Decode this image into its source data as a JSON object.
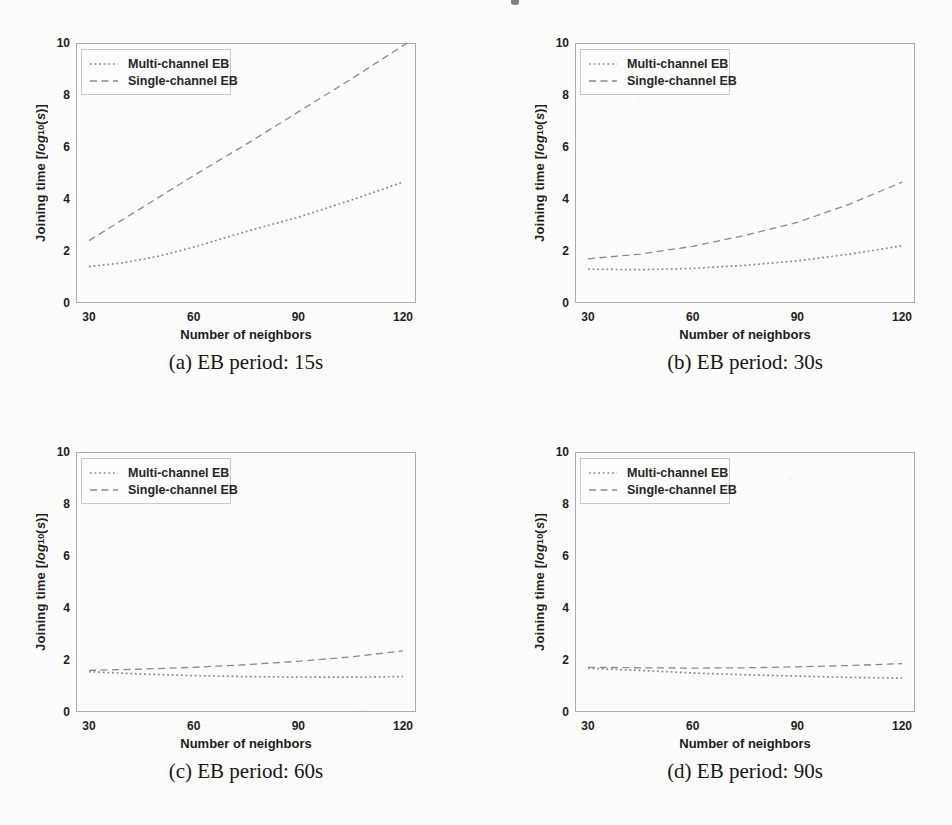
{
  "colors": {
    "line": "#8a8a8a",
    "text": "#1e1e1e",
    "frame": "#ababab",
    "page_background": "#fcfcfa"
  },
  "chart_data": [
    {
      "id": "a",
      "type": "line",
      "caption": "(a) EB period: 15s",
      "xlabel": "Number of neighbors",
      "ylabel_text": "Joining time [log10(s)]",
      "ylabel_parts": [
        {
          "text": "Joining time [",
          "style": "normal"
        },
        {
          "text": "log",
          "style": "italic"
        },
        {
          "text": "10",
          "style": "sub"
        },
        {
          "text": "(",
          "style": "normal"
        },
        {
          "text": "s",
          "style": "italic"
        },
        {
          "text": ")]",
          "style": "normal"
        }
      ],
      "xlim": [
        30,
        120
      ],
      "ylim": [
        0,
        10
      ],
      "x_ticks": [
        30,
        60,
        90,
        120
      ],
      "y_ticks": [
        0,
        2,
        4,
        6,
        8,
        10
      ],
      "grid": false,
      "legend_position": "upper-left",
      "legend": [
        {
          "label": "Multi-channel EB",
          "style": "dotted"
        },
        {
          "label": "Single-channel EB",
          "style": "dashed"
        }
      ],
      "series": [
        {
          "name": "Multi-channel EB",
          "style": "dotted",
          "points": [
            [
              30,
              1.4
            ],
            [
              40,
              1.55
            ],
            [
              50,
              1.8
            ],
            [
              60,
              2.15
            ],
            [
              75,
              2.75
            ],
            [
              90,
              3.3
            ],
            [
              105,
              3.95
            ],
            [
              120,
              4.65
            ]
          ]
        },
        {
          "name": "Single-channel EB",
          "style": "dashed",
          "extend_past_axis": true,
          "points": [
            [
              30,
              2.4
            ],
            [
              45,
              3.65
            ],
            [
              60,
              4.9
            ],
            [
              75,
              6.1
            ],
            [
              90,
              7.35
            ],
            [
              105,
              8.6
            ],
            [
              120,
              9.9
            ]
          ]
        }
      ]
    },
    {
      "id": "b",
      "type": "line",
      "caption": "(b) EB period: 30s",
      "xlabel": "Number of neighbors",
      "ylabel_text": "Joining time [log10(s)]",
      "ylabel_parts": [
        {
          "text": "Joining time [",
          "style": "normal"
        },
        {
          "text": "log",
          "style": "italic"
        },
        {
          "text": "10",
          "style": "sub"
        },
        {
          "text": "(",
          "style": "normal"
        },
        {
          "text": "s",
          "style": "italic"
        },
        {
          "text": ")]",
          "style": "normal"
        }
      ],
      "xlim": [
        30,
        120
      ],
      "ylim": [
        0,
        10
      ],
      "x_ticks": [
        30,
        60,
        90,
        120
      ],
      "y_ticks": [
        0,
        2,
        4,
        6,
        8,
        10
      ],
      "grid": false,
      "legend_position": "upper-left",
      "legend": [
        {
          "label": "Multi-channel EB",
          "style": "dotted"
        },
        {
          "label": "Single-channel EB",
          "style": "dashed"
        }
      ],
      "series": [
        {
          "name": "Multi-channel EB",
          "style": "dotted",
          "points": [
            [
              30,
              1.3
            ],
            [
              45,
              1.28
            ],
            [
              60,
              1.33
            ],
            [
              75,
              1.45
            ],
            [
              90,
              1.62
            ],
            [
              105,
              1.88
            ],
            [
              120,
              2.2
            ]
          ]
        },
        {
          "name": "Single-channel EB",
          "style": "dashed",
          "points": [
            [
              30,
              1.7
            ],
            [
              45,
              1.88
            ],
            [
              60,
              2.18
            ],
            [
              75,
              2.6
            ],
            [
              90,
              3.1
            ],
            [
              105,
              3.8
            ],
            [
              120,
              4.65
            ]
          ]
        }
      ]
    },
    {
      "id": "c",
      "type": "line",
      "caption": "(c) EB period: 60s",
      "xlabel": "Number of neighbors",
      "ylabel_text": "Joining time [log10(s)]",
      "ylabel_parts": [
        {
          "text": "Joining time [",
          "style": "normal"
        },
        {
          "text": "log",
          "style": "italic"
        },
        {
          "text": "10",
          "style": "sub"
        },
        {
          "text": "(",
          "style": "normal"
        },
        {
          "text": "s",
          "style": "italic"
        },
        {
          "text": ")]",
          "style": "normal"
        }
      ],
      "xlim": [
        30,
        120
      ],
      "ylim": [
        0,
        10
      ],
      "x_ticks": [
        30,
        60,
        90,
        120
      ],
      "y_ticks": [
        0,
        2,
        4,
        6,
        8,
        10
      ],
      "grid": false,
      "legend_position": "upper-left",
      "legend": [
        {
          "label": "Multi-channel EB",
          "style": "dotted"
        },
        {
          "label": "Single-channel EB",
          "style": "dashed"
        }
      ],
      "series": [
        {
          "name": "Multi-channel EB",
          "style": "dotted",
          "points": [
            [
              30,
              1.55
            ],
            [
              45,
              1.46
            ],
            [
              60,
              1.4
            ],
            [
              75,
              1.36
            ],
            [
              90,
              1.34
            ],
            [
              105,
              1.34
            ],
            [
              120,
              1.36
            ]
          ]
        },
        {
          "name": "Single-channel EB",
          "style": "dashed",
          "points": [
            [
              30,
              1.6
            ],
            [
              45,
              1.65
            ],
            [
              60,
              1.72
            ],
            [
              75,
              1.82
            ],
            [
              90,
              1.95
            ],
            [
              105,
              2.12
            ],
            [
              120,
              2.35
            ]
          ]
        }
      ]
    },
    {
      "id": "d",
      "type": "line",
      "caption": "(d) EB period: 90s",
      "xlabel": "Number of neighbors",
      "ylabel_text": "Joining time [log10(s)]",
      "ylabel_parts": [
        {
          "text": "Joining time [",
          "style": "normal"
        },
        {
          "text": "log",
          "style": "italic"
        },
        {
          "text": "10",
          "style": "sub"
        },
        {
          "text": "(",
          "style": "normal"
        },
        {
          "text": "s",
          "style": "italic"
        },
        {
          "text": ")]",
          "style": "normal"
        }
      ],
      "xlim": [
        30,
        120
      ],
      "ylim": [
        0,
        10
      ],
      "x_ticks": [
        30,
        60,
        90,
        120
      ],
      "y_ticks": [
        0,
        2,
        4,
        6,
        8,
        10
      ],
      "grid": false,
      "legend_position": "upper-left",
      "legend": [
        {
          "label": "Multi-channel EB",
          "style": "dotted"
        },
        {
          "label": "Single-channel EB",
          "style": "dashed"
        }
      ],
      "series": [
        {
          "name": "Multi-channel EB",
          "style": "dotted",
          "points": [
            [
              30,
              1.68
            ],
            [
              45,
              1.6
            ],
            [
              60,
              1.5
            ],
            [
              75,
              1.43
            ],
            [
              90,
              1.38
            ],
            [
              105,
              1.33
            ],
            [
              120,
              1.3
            ]
          ]
        },
        {
          "name": "Single-channel EB",
          "style": "dashed",
          "points": [
            [
              30,
              1.72
            ],
            [
              45,
              1.7
            ],
            [
              60,
              1.69
            ],
            [
              75,
              1.7
            ],
            [
              90,
              1.74
            ],
            [
              105,
              1.79
            ],
            [
              120,
              1.86
            ]
          ]
        }
      ]
    }
  ]
}
